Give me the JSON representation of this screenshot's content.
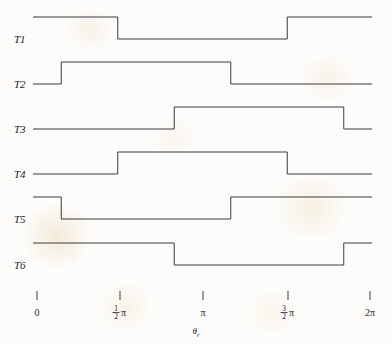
{
  "figure": {
    "kind": "timing-diagram",
    "background_color": "#fdfcfa",
    "line_color": "#3a3a3c",
    "axis_title": "θ",
    "axis_title_subscript": "r"
  },
  "chart_data": {
    "type": "line",
    "title": "",
    "xlabel": "θr",
    "ylabel": "",
    "grid": false,
    "legend": "none",
    "xlim": [
      0,
      6.283185
    ],
    "x_unit": "radians",
    "x_ticks": [
      {
        "value": 0,
        "label": "0",
        "kind": "plain"
      },
      {
        "value": 1.5707963,
        "label": "½π",
        "kind": "fraction",
        "numerator": "1",
        "denominator": "2",
        "suffix": "π"
      },
      {
        "value": 3.1415927,
        "label": "π",
        "kind": "plain"
      },
      {
        "value": 4.712389,
        "label": "3/2π",
        "kind": "fraction",
        "numerator": "3",
        "denominator": "2",
        "suffix": "π"
      },
      {
        "value": 6.283185,
        "label": "2π",
        "kind": "plain"
      }
    ],
    "signal_levels": {
      "low": 0,
      "high": 1
    },
    "series": [
      {
        "name": "T1",
        "initial_level": 1,
        "transitions_rad": [
          1.5707963,
          4.712389
        ],
        "levels_after": [
          0,
          1
        ],
        "segments": [
          {
            "start_rad": 0.0,
            "end_rad": 1.5707963,
            "level": 1
          },
          {
            "start_rad": 1.5707963,
            "end_rad": 4.712389,
            "level": 0
          },
          {
            "start_rad": 4.712389,
            "end_rad": 6.283185,
            "level": 1
          }
        ]
      },
      {
        "name": "T2",
        "initial_level": 0,
        "transitions_rad": [
          0.5235988,
          3.6651914
        ],
        "levels_after": [
          1,
          0
        ],
        "segments": [
          {
            "start_rad": 0.0,
            "end_rad": 0.5235988,
            "level": 0
          },
          {
            "start_rad": 0.5235988,
            "end_rad": 3.6651914,
            "level": 1
          },
          {
            "start_rad": 3.6651914,
            "end_rad": 6.283185,
            "level": 0
          }
        ]
      },
      {
        "name": "T3",
        "initial_level": 0,
        "transitions_rad": [
          2.6179939,
          5.7595865
        ],
        "levels_after": [
          1,
          0
        ],
        "segments": [
          {
            "start_rad": 0.0,
            "end_rad": 2.6179939,
            "level": 0
          },
          {
            "start_rad": 2.6179939,
            "end_rad": 5.7595865,
            "level": 1
          },
          {
            "start_rad": 5.7595865,
            "end_rad": 6.283185,
            "level": 0
          }
        ]
      },
      {
        "name": "T4",
        "initial_level": 0,
        "transitions_rad": [
          1.5707963,
          4.712389
        ],
        "levels_after": [
          1,
          0
        ],
        "segments": [
          {
            "start_rad": 0.0,
            "end_rad": 1.5707963,
            "level": 0
          },
          {
            "start_rad": 1.5707963,
            "end_rad": 4.712389,
            "level": 1
          },
          {
            "start_rad": 4.712389,
            "end_rad": 6.283185,
            "level": 0
          }
        ]
      },
      {
        "name": "T5",
        "initial_level": 1,
        "transitions_rad": [
          0.5235988,
          3.6651914
        ],
        "levels_after": [
          0,
          1
        ],
        "segments": [
          {
            "start_rad": 0.0,
            "end_rad": 0.5235988,
            "level": 1
          },
          {
            "start_rad": 0.5235988,
            "end_rad": 3.6651914,
            "level": 0
          },
          {
            "start_rad": 3.6651914,
            "end_rad": 6.283185,
            "level": 1
          }
        ]
      },
      {
        "name": "T6",
        "initial_level": 1,
        "transitions_rad": [
          2.6179939,
          5.7595865
        ],
        "levels_after": [
          0,
          1
        ],
        "segments": [
          {
            "start_rad": 0.0,
            "end_rad": 2.6179939,
            "level": 1
          },
          {
            "start_rad": 2.6179939,
            "end_rad": 5.7595865,
            "level": 0
          },
          {
            "start_rad": 5.7595865,
            "end_rad": 6.283185,
            "level": 1
          }
        ]
      }
    ]
  },
  "geometry": {
    "x_origin_px": 33,
    "x_end_px": 372,
    "tick_px": [
      37,
      120,
      203,
      288,
      370
    ],
    "baselines_px": [
      39,
      84,
      129,
      174,
      219,
      265
    ],
    "pulse_height_px": 22,
    "label_x_px": 14,
    "tick_y_top_px": 291,
    "tick_y_bottom_px": 300,
    "tick_label_y_px": 316,
    "axis_title_x_px": 196,
    "axis_title_y_px": 334
  }
}
